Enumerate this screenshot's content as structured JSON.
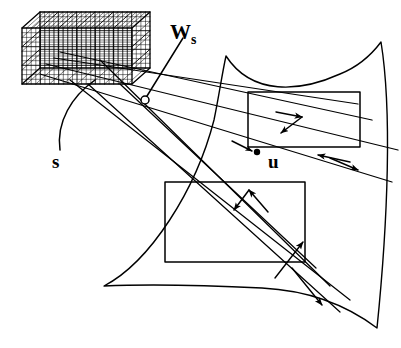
{
  "figure": {
    "background_color": "#ffffff",
    "stroke_color": "#000000",
    "width": 401,
    "height": 348
  },
  "labels": {
    "w_s": {
      "text": "W",
      "subscript": "s",
      "full": "Ws",
      "x": 170,
      "y": 22
    },
    "s": {
      "text": "s",
      "full": "s",
      "x": 52,
      "y": 152
    },
    "u": {
      "text": "u",
      "full": "u",
      "x": 268,
      "y": 152
    }
  },
  "elements": {
    "voxel_grid": {
      "name": "voxel-grid-box",
      "description": "3D wireframe box subdivided into a fine lattice of voxels, drawn in the upper-left",
      "front_face": {
        "x": 22,
        "y": 28,
        "width": 110,
        "height": 56
      },
      "depth_offset": {
        "dx": 18,
        "dy": -16
      },
      "columns": 6,
      "rows": 3,
      "sub_divisions": 4
    },
    "surface_patch": {
      "name": "curved-surface-patch",
      "description": "Large closed curved quadrilateral (bulging/concave edges) occupying the right portion",
      "corners": [
        {
          "x": 226,
          "y": 56
        },
        {
          "x": 381,
          "y": 42
        },
        {
          "x": 377,
          "y": 328
        },
        {
          "x": 104,
          "y": 286
        }
      ]
    },
    "rectangle_upper": {
      "name": "upper-window-rectangle",
      "x": 248,
      "y": 92,
      "width": 112,
      "height": 55
    },
    "rectangle_lower": {
      "name": "lower-window-rectangle",
      "x": 165,
      "y": 182,
      "width": 140,
      "height": 80
    },
    "ws_marker": {
      "name": "ws-sample-point-marker",
      "shape": "open-circle",
      "x": 145,
      "y": 100,
      "radius": 4
    },
    "u_marker": {
      "name": "u-sample-point-marker",
      "shape": "filled-dot",
      "x": 257,
      "y": 152,
      "radius": 3.2
    },
    "rays": {
      "name": "projection-rays",
      "count": 8,
      "description": "Straight lines fanning from the voxel grid across the surface patch"
    },
    "arrow_pairs": [
      {
        "name": "upper-rect-vector-pair",
        "vertex_x": 300,
        "vertex_y": 124
      },
      {
        "name": "lower-rect-vector-pair",
        "vertex_x": 250,
        "vertex_y": 200
      }
    ]
  }
}
